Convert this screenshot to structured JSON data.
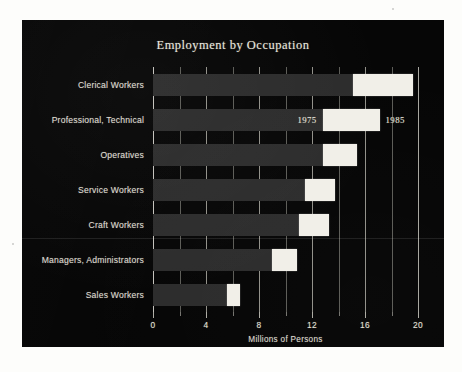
{
  "chart_data": {
    "type": "bar",
    "orientation": "horizontal",
    "title": "Employment by Occupation",
    "xlabel": "Millions of Persons",
    "ylabel": "",
    "xlim": [
      0,
      20
    ],
    "xticks": [
      0,
      4,
      8,
      12,
      16,
      20
    ],
    "xtick_labels": [
      "0",
      "4",
      "8",
      "12",
      "16",
      "20"
    ],
    "minor_xticks": [
      2,
      6,
      10,
      14,
      18
    ],
    "grid": true,
    "grid_axis": "x",
    "legend": "inline-annotation",
    "annotations": [
      {
        "text": "1975",
        "series": "1975",
        "category": "Professional, Technical"
      },
      {
        "text": "1985",
        "series": "1985",
        "category": "Professional, Technical"
      }
    ],
    "categories": [
      "Clerical Workers",
      "Professional, Technical",
      "Operatives",
      "Service Workers",
      "Craft Workers",
      "Managers, Administrators",
      "Sales Workers"
    ],
    "series": [
      {
        "name": "1975",
        "color": "#2c2c2c",
        "values": [
          15.1,
          12.8,
          12.8,
          11.5,
          11.0,
          9.0,
          5.6
        ]
      },
      {
        "name": "1985",
        "color": "#f1efe8",
        "values": [
          19.6,
          17.1,
          15.4,
          13.7,
          13.3,
          10.9,
          6.6
        ]
      }
    ]
  },
  "panel": {
    "background_color": "#060606",
    "text_color": "#e3e0d6"
  },
  "page": {
    "background_color": "#fdfdfb"
  }
}
